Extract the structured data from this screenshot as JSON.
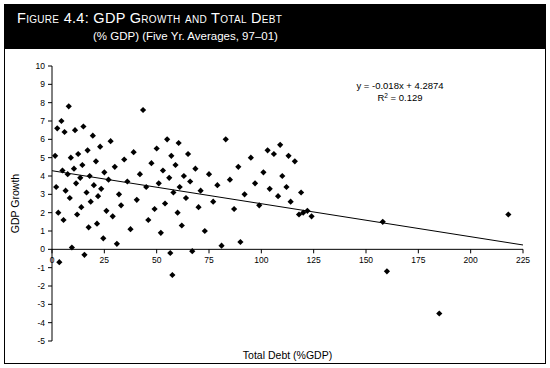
{
  "figure": {
    "title_main": "Figure 4.4:  GDP Growth and Total Debt",
    "title_sub": "(% GDP) (Five Yr. Averages, 97–01)"
  },
  "annotation": {
    "equation": "y = -0.018x + 4.2874",
    "r_squared_label": "R",
    "r_squared_exp": "2",
    "r_squared_value": " = 0.129"
  },
  "chart_data": {
    "type": "scatter",
    "title": "Figure 4.4:  GDP Growth and Total Debt",
    "subtitle": "(% GDP) (Five Yr. Averages, 97–01)",
    "xlabel": "Total Debt (%GDP)",
    "ylabel": "GDP Growth",
    "xlim": [
      0,
      225
    ],
    "ylim": [
      -5,
      10
    ],
    "xticks": [
      0,
      25,
      50,
      75,
      100,
      125,
      150,
      175,
      200,
      225
    ],
    "xtick_labels": [
      "0",
      "25",
      "50",
      "75",
      "100",
      "125",
      "150",
      "175",
      "200",
      "225"
    ],
    "yticks": [
      -5,
      -4,
      -3,
      -2,
      -1,
      0,
      1,
      2,
      3,
      4,
      5,
      6,
      7,
      8,
      9,
      10
    ],
    "ytick_labels": [
      "-5",
      "-4",
      "-3",
      "-2",
      "-1",
      "0",
      "1",
      "2",
      "3",
      "4",
      "5",
      "6",
      "7",
      "8",
      "9",
      "10"
    ],
    "grid": false,
    "legend": "none",
    "marker": "diamond",
    "marker_color": "#000000",
    "zero_line": true,
    "trendline": {
      "type": "linear",
      "slope": -0.018,
      "intercept": 4.2874,
      "r_squared": 0.129,
      "equation_text": "y = -0.018x + 4.2874",
      "x_start": 0,
      "x_end": 225
    },
    "points": [
      [
        1.5,
        5.1
      ],
      [
        2.0,
        3.4
      ],
      [
        2.5,
        6.6
      ],
      [
        3.0,
        2.0
      ],
      [
        3.5,
        -0.7
      ],
      [
        4.5,
        7.0
      ],
      [
        5.0,
        4.3
      ],
      [
        5.5,
        1.6
      ],
      [
        6.0,
        6.4
      ],
      [
        6.5,
        3.2
      ],
      [
        7.5,
        4.1
      ],
      [
        8.0,
        7.8
      ],
      [
        8.5,
        2.8
      ],
      [
        9.0,
        5.0
      ],
      [
        9.5,
        0.1
      ],
      [
        10.5,
        4.4
      ],
      [
        11.0,
        6.5
      ],
      [
        11.5,
        3.6
      ],
      [
        12.0,
        1.9
      ],
      [
        12.5,
        5.2
      ],
      [
        13.5,
        3.9
      ],
      [
        14.0,
        2.3
      ],
      [
        14.5,
        4.6
      ],
      [
        15.0,
        6.7
      ],
      [
        15.5,
        -0.3
      ],
      [
        16.5,
        3.1
      ],
      [
        17.0,
        5.4
      ],
      [
        17.5,
        1.2
      ],
      [
        18.0,
        4.0
      ],
      [
        18.5,
        2.6
      ],
      [
        19.5,
        6.2
      ],
      [
        20.0,
        3.5
      ],
      [
        21.0,
        4.8
      ],
      [
        21.5,
        1.4
      ],
      [
        22.0,
        2.9
      ],
      [
        23.0,
        5.6
      ],
      [
        23.5,
        3.3
      ],
      [
        24.5,
        0.6
      ],
      [
        25.0,
        4.2
      ],
      [
        26.0,
        2.1
      ],
      [
        27.0,
        3.8
      ],
      [
        28.0,
        5.9
      ],
      [
        29.0,
        1.8
      ],
      [
        30.0,
        4.5
      ],
      [
        31.0,
        0.3
      ],
      [
        32.0,
        3.0
      ],
      [
        33.0,
        2.4
      ],
      [
        34.5,
        4.9
      ],
      [
        36.0,
        3.7
      ],
      [
        37.5,
        1.1
      ],
      [
        39.0,
        5.3
      ],
      [
        40.5,
        2.7
      ],
      [
        42.0,
        4.1
      ],
      [
        43.5,
        7.6
      ],
      [
        45.0,
        3.4
      ],
      [
        46.0,
        1.6
      ],
      [
        47.5,
        4.7
      ],
      [
        49.0,
        2.2
      ],
      [
        50.0,
        5.5
      ],
      [
        51.0,
        3.6
      ],
      [
        52.0,
        0.9
      ],
      [
        53.0,
        4.3
      ],
      [
        54.0,
        2.5
      ],
      [
        55.0,
        6.0
      ],
      [
        56.0,
        3.9
      ],
      [
        56.5,
        -0.2
      ],
      [
        57.0,
        5.1
      ],
      [
        57.5,
        -1.4
      ],
      [
        58.0,
        3.1
      ],
      [
        59.0,
        4.6
      ],
      [
        60.0,
        2.0
      ],
      [
        60.5,
        5.8
      ],
      [
        61.0,
        3.4
      ],
      [
        62.0,
        1.3
      ],
      [
        63.0,
        4.0
      ],
      [
        64.0,
        2.8
      ],
      [
        65.0,
        5.2
      ],
      [
        66.0,
        3.7
      ],
      [
        67.0,
        -0.1
      ],
      [
        68.5,
        4.4
      ],
      [
        70.0,
        2.3
      ],
      [
        71.0,
        3.2
      ],
      [
        73.0,
        1.0
      ],
      [
        75.0,
        4.1
      ],
      [
        77.0,
        2.6
      ],
      [
        79.0,
        3.5
      ],
      [
        81.0,
        0.2
      ],
      [
        83.0,
        6.0
      ],
      [
        85.0,
        3.8
      ],
      [
        87.0,
        2.2
      ],
      [
        89.0,
        4.5
      ],
      [
        90.0,
        0.4
      ],
      [
        92.0,
        3.0
      ],
      [
        95.0,
        5.0
      ],
      [
        97.0,
        3.6
      ],
      [
        99.0,
        2.4
      ],
      [
        101.0,
        4.2
      ],
      [
        103.0,
        5.4
      ],
      [
        104.0,
        3.3
      ],
      [
        106.0,
        5.2
      ],
      [
        108.0,
        2.9
      ],
      [
        109.0,
        5.7
      ],
      [
        110.0,
        4.0
      ],
      [
        112.0,
        3.4
      ],
      [
        113.0,
        5.1
      ],
      [
        114.0,
        2.6
      ],
      [
        116.0,
        4.8
      ],
      [
        118.0,
        1.9
      ],
      [
        119.0,
        3.1
      ],
      [
        120.0,
        2.0
      ],
      [
        122.0,
        2.1
      ],
      [
        124.0,
        1.8
      ],
      [
        158.0,
        1.5
      ],
      [
        160.0,
        -1.2
      ],
      [
        185.0,
        -3.5
      ],
      [
        218.0,
        1.9
      ]
    ]
  },
  "axes": {
    "x_title": "Total Debt (%GDP)",
    "y_title": "GDP Growth"
  }
}
